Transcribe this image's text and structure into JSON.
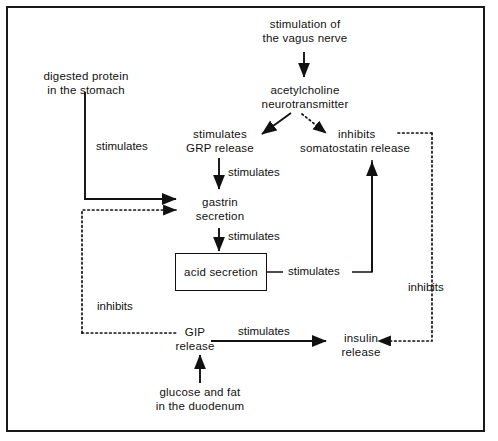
{
  "diagram": {
    "type": "flowchart",
    "frame": {
      "border_color": "#1a1a1a",
      "background": "#ffffff"
    },
    "line_color": "#111111",
    "nodes": [
      {
        "id": "vagus",
        "label": "stimulation of\nthe vagus nerve",
        "line1": "stimulation of",
        "line2": "the vagus nerve",
        "shape": "plain"
      },
      {
        "id": "acetylcholine",
        "label": "acetylcholine\nneurotransmitter",
        "line1": "acetylcholine",
        "line2": "neurotransmitter",
        "shape": "plain"
      },
      {
        "id": "protein",
        "label": "digested protein\nin the stomach",
        "line1": "digested protein",
        "line2": "in the stomach",
        "shape": "plain"
      },
      {
        "id": "grp",
        "label": "stimulates\nGRP release",
        "line1": "stimulates",
        "line2": "GRP release",
        "shape": "plain"
      },
      {
        "id": "somatostatin",
        "label": "inhibits\nsomatostatin release",
        "line1": "inhibits",
        "line2": "somatostatin release",
        "shape": "plain"
      },
      {
        "id": "gastrin",
        "label": "gastrin\nsecretion",
        "line1": "gastrin",
        "line2": "secretion",
        "shape": "plain"
      },
      {
        "id": "acid",
        "label": "acid  secretion",
        "line1": "acid  secretion",
        "line2": "",
        "shape": "box"
      },
      {
        "id": "gip",
        "label": "GIP\nrelease",
        "line1": "GIP",
        "line2": "release",
        "shape": "plain"
      },
      {
        "id": "insulin",
        "label": "insulin\nrelease",
        "line1": "insulin",
        "line2": "release",
        "shape": "plain"
      },
      {
        "id": "glucose",
        "label": "glucose and fat\nin the duodenum",
        "line1": "glucose and fat",
        "line2": "in the duodenum",
        "shape": "plain"
      }
    ],
    "edges": [
      {
        "from": "vagus",
        "to": "acetylcholine",
        "label": "",
        "style": "solid"
      },
      {
        "from": "acetylcholine",
        "to": "grp",
        "label": "",
        "style": "solid"
      },
      {
        "from": "acetylcholine",
        "to": "somatostatin",
        "label": "",
        "style": "dotted"
      },
      {
        "from": "protein",
        "to": "gastrin",
        "label": "stimulates",
        "style": "solid"
      },
      {
        "from": "grp",
        "to": "gastrin",
        "label": "stimulates",
        "style": "solid"
      },
      {
        "from": "gastrin",
        "to": "acid",
        "label": "stimulates",
        "style": "solid"
      },
      {
        "from": "acid",
        "to": "somatostatin",
        "label": "stimulates",
        "style": "solid"
      },
      {
        "from": "somatostatin",
        "to": "gastrin",
        "label": "inhibits",
        "style": "dotted"
      },
      {
        "from": "somatostatin",
        "to": "insulin",
        "label": "inhibits",
        "style": "dotted"
      },
      {
        "from": "gip",
        "to": "insulin",
        "label": "stimulates",
        "style": "solid"
      },
      {
        "from": "glucose",
        "to": "gip",
        "label": "",
        "style": "solid"
      }
    ],
    "edge_labels": {
      "protein_gastrin": "stimulates",
      "grp_gastrin": "stimulates",
      "gastrin_acid": "stimulates",
      "acid_somatostatin": "stimulates",
      "gip_insulin": "stimulates",
      "left_inhibits": "inhibits",
      "right_inhibits": "inhibits"
    }
  }
}
